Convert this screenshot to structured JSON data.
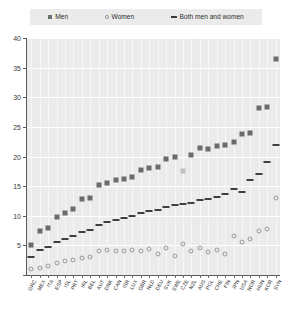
{
  "legend": {
    "items": [
      {
        "key": "men",
        "label": "Men",
        "icon": "filled-square-marker"
      },
      {
        "key": "women",
        "label": "Women",
        "icon": "open-circle-marker"
      },
      {
        "key": "both",
        "label": "Both men and women",
        "icon": "dash-line-marker"
      }
    ]
  },
  "axes": {
    "y_ticks": [
      0,
      5,
      10,
      15,
      20,
      25,
      30,
      35,
      40
    ],
    "y_tick_labels": [
      "",
      "5",
      "10",
      "15",
      "20",
      "25",
      "30",
      "35",
      "40"
    ],
    "ylim": [
      0,
      40
    ]
  },
  "colors": {
    "plot_background": "#ebebeb",
    "legend_background": "#ebebeb",
    "gridline": "#ffffff",
    "men_marker": "#6b6b6b",
    "men_marker_highlight": "#c0c0c0",
    "women_marker_stroke": "#9a9a9a",
    "both_marker": "#3f3f3f",
    "axis": "#5a5a5a",
    "text": "#2e2e2e"
  },
  "chart_data": {
    "type": "scatter",
    "title": "",
    "xlabel": "",
    "ylabel": "",
    "ylim": [
      0,
      40
    ],
    "grid": true,
    "legend_position": "top",
    "categories": [
      "GRC",
      "MEX",
      "ITA",
      "ESP",
      "ISL",
      "PRT",
      "IRL",
      "BEL",
      "AUT",
      "DNK",
      "CAN",
      "ISR",
      "LUX",
      "GBR",
      "NLD",
      "DEU",
      "SVK",
      "SWE",
      "CZE",
      "NZL",
      "AUS",
      "POL",
      "CHE",
      "FIN",
      "JPN",
      "USA",
      "NOR",
      "HUN",
      "KOR",
      "SVN"
    ],
    "series": [
      {
        "name": "Men",
        "values": [
          5.0,
          7.5,
          8.0,
          9.8,
          10.5,
          11.2,
          12.8,
          13.0,
          15.2,
          15.5,
          16.0,
          16.2,
          16.5,
          17.8,
          18.0,
          18.3,
          19.5,
          20.0,
          17.5,
          20.2,
          21.5,
          21.3,
          21.7,
          22.0,
          22.5,
          23.8,
          24.0,
          28.2,
          28.3,
          36.5
        ]
      },
      {
        "name": "Women",
        "values": [
          1.0,
          1.2,
          1.5,
          2.0,
          2.3,
          2.6,
          2.8,
          3.0,
          4.0,
          4.2,
          4.1,
          4.0,
          4.3,
          4.1,
          4.4,
          3.5,
          4.6,
          3.2,
          5.2,
          4.0,
          4.5,
          3.8,
          4.2,
          3.5,
          6.5,
          5.5,
          6.0,
          7.5,
          7.8,
          13.0
        ]
      },
      {
        "name": "Both men and women",
        "values": [
          3.0,
          4.2,
          4.8,
          5.5,
          6.0,
          6.5,
          7.2,
          7.6,
          8.5,
          9.0,
          9.3,
          9.6,
          9.9,
          10.4,
          10.8,
          11.0,
          11.5,
          11.8,
          12.0,
          12.2,
          12.6,
          12.9,
          13.2,
          13.6,
          14.5,
          14.0,
          16.0,
          17.0,
          19.0,
          22.0
        ]
      }
    ],
    "highlight_index": 18,
    "highlight_series": "Men"
  }
}
